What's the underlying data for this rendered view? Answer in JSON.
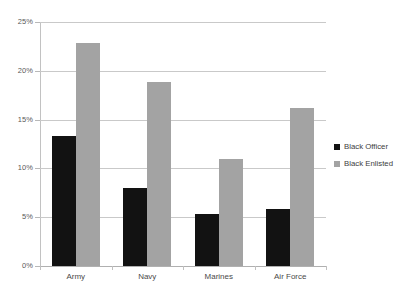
{
  "chart_data": {
    "type": "bar",
    "title": "",
    "subtitle": "",
    "xlabel": "",
    "ylabel": "",
    "categories": [
      "Army",
      "Navy",
      "Marines",
      "Air Force"
    ],
    "series": [
      {
        "name": "Black Officer",
        "color": "#121212",
        "values": [
          13.3,
          8.0,
          5.3,
          5.8
        ]
      },
      {
        "name": "Black Enlisted",
        "color": "#a3a3a3",
        "values": [
          22.8,
          18.9,
          11.0,
          16.2
        ]
      }
    ],
    "ylim": [
      0,
      25
    ],
    "ytick_values": [
      0,
      5,
      10,
      15,
      20,
      25
    ],
    "ytick_labels": [
      "0%",
      "5%",
      "10%",
      "15%",
      "20%",
      "25%"
    ],
    "value_suffix": "%",
    "grid": true,
    "grid_axis": "y",
    "legend_position": "right",
    "background": "#ffffff",
    "gridline_color": "#c9c9c9",
    "axis_color": "#c2c2c2",
    "tick_label_color": "#595959",
    "category_label_color": "#4a4a4a"
  }
}
